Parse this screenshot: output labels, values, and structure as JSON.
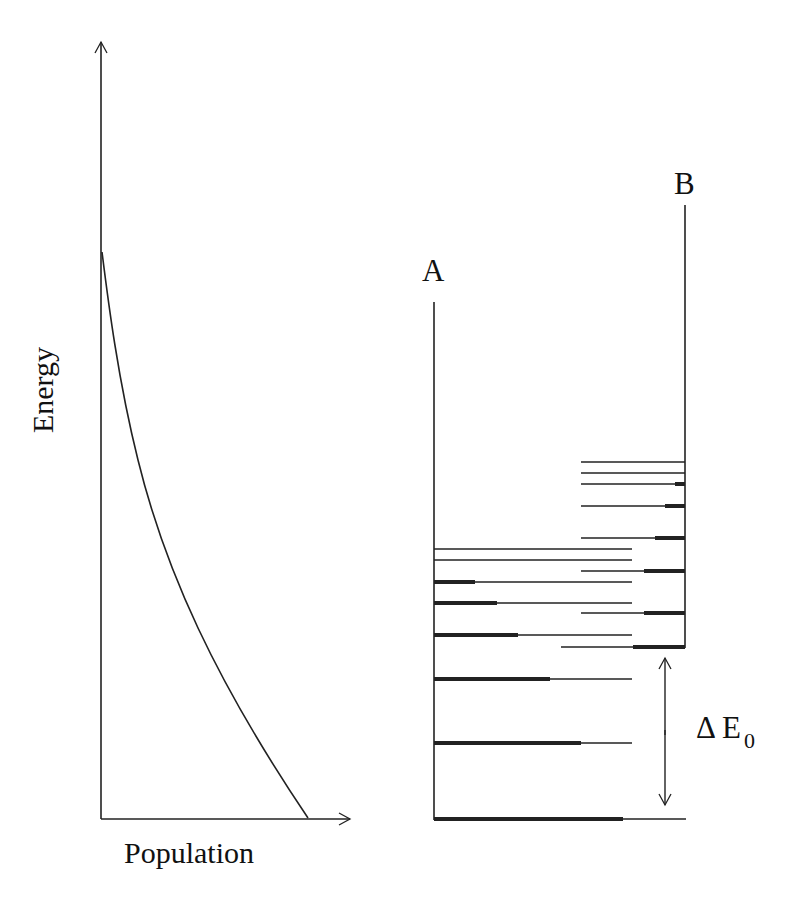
{
  "diagram": {
    "left_plot": {
      "y_axis_label": "Energy",
      "x_axis_label": "Population",
      "curve": "decaying population vs energy (Boltzmann-like)"
    },
    "right_plot": {
      "column_a_label": "A",
      "column_b_label": "B",
      "gap_label_symbol": "Δ E",
      "gap_label_subscript": "0",
      "levels_a": [
        {
          "y": 549,
          "thick_to": 434,
          "thin_to": 632
        },
        {
          "y": 560,
          "thick_to": 434,
          "thin_to": 632
        },
        {
          "y": 582,
          "thick_to": 475,
          "thin_to": 632
        },
        {
          "y": 603,
          "thick_to": 497,
          "thin_to": 632
        },
        {
          "y": 635,
          "thick_to": 518,
          "thin_to": 632
        },
        {
          "y": 679,
          "thick_to": 550,
          "thin_to": 632
        },
        {
          "y": 743,
          "thick_to": 581,
          "thin_to": 632
        },
        {
          "y": 819,
          "thick_to": 623,
          "thin_to": 686
        }
      ],
      "levels_b": [
        {
          "y": 462,
          "start": 581,
          "thick_from": 685
        },
        {
          "y": 473,
          "start": 581,
          "thick_from": 685
        },
        {
          "y": 484,
          "start": 581,
          "thick_from": 675
        },
        {
          "y": 506,
          "start": 581,
          "thick_from": 665
        },
        {
          "y": 538,
          "start": 581,
          "thick_from": 655
        },
        {
          "y": 571,
          "start": 581,
          "thick_from": 644
        },
        {
          "y": 613,
          "start": 581,
          "thick_from": 644
        },
        {
          "y": 647,
          "start": 561,
          "thick_from": 633
        }
      ]
    }
  }
}
